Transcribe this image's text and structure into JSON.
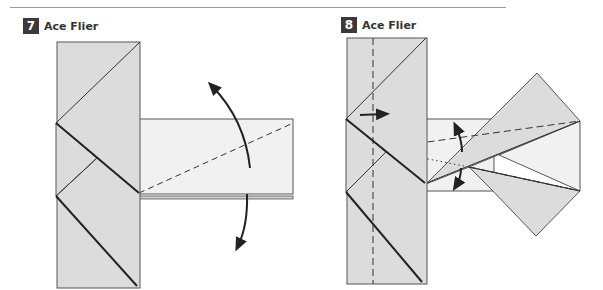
{
  "steps": [
    {
      "number": "7",
      "title": "Ace Flier"
    },
    {
      "number": "8",
      "title": "Ace Flier"
    }
  ],
  "colors": {
    "paper_shaded": "#dcdcdc",
    "paper_light": "#f1f1f1",
    "line": "#3a3a3a",
    "step_badge": "#3a3a3a",
    "rule": "#9a9a9a"
  }
}
